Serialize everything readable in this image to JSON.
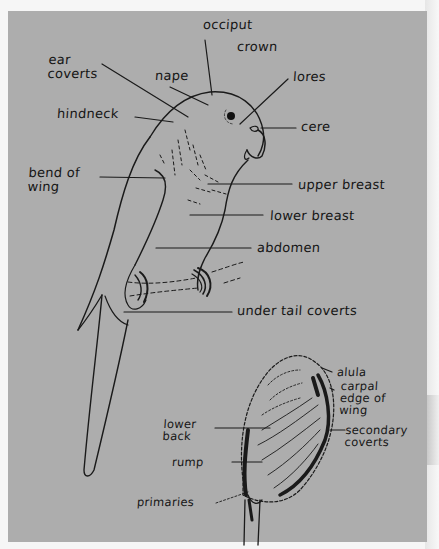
{
  "diagram": {
    "paper_color": "#adadad",
    "ink_color": "#151515",
    "labels": {
      "occiput": "occiput",
      "crown": "crown",
      "ear_coverts": "ear\ncoverts",
      "nape": "nape",
      "lores": "lores",
      "hindneck": "hindneck",
      "cere": "cere",
      "bend_of_wing": "bend of\nwing",
      "upper_breast": "upper breast",
      "lower_breast": "lower breast",
      "abdomen": "abdomen",
      "under_tail_coverts": "under tail coverts",
      "alula": "alula",
      "carpal_edge_of_wing": "carpal\nedge of\nwing",
      "secondary_coverts": "secondary\ncoverts",
      "lower_back": "lower\nback",
      "rump": "rump",
      "primaries": "primaries"
    },
    "figures": [
      {
        "name": "perched-parrot-front-view",
        "view": "front"
      },
      {
        "name": "parrot-back-view",
        "view": "back"
      }
    ]
  }
}
